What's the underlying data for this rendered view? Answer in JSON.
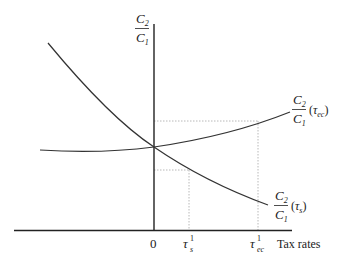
{
  "diagram": {
    "y_axis_label": {
      "numerator": "C",
      "numerator_sub": "2",
      "denominator": "C",
      "denominator_sub": "1"
    },
    "x_axis_label": "Tax rates",
    "origin_label": "0",
    "tick_labels": [
      {
        "symbol": "τ",
        "sup": "1",
        "sub": "s"
      },
      {
        "symbol": "τ",
        "sup": "1",
        "sub": "ec"
      }
    ],
    "curves": [
      {
        "name": "ratio-vs-tau-ec",
        "numerator": "C",
        "numerator_sub": "2",
        "denominator": "C",
        "denominator_sub": "1",
        "arg_symbol": "τ",
        "arg_sub": "ec",
        "shape": "increasing"
      },
      {
        "name": "ratio-vs-tau-s",
        "numerator": "C",
        "numerator_sub": "2",
        "denominator": "C",
        "denominator_sub": "1",
        "arg_symbol": "τ",
        "arg_sub": "s",
        "shape": "decreasing"
      }
    ],
    "colors": {
      "axis": "#222222",
      "curve": "#333333",
      "guide": "#b0b0b0"
    }
  }
}
